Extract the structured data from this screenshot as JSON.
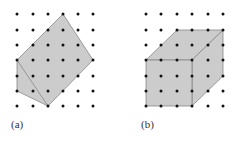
{
  "figures": [
    {
      "id": "a",
      "label": "(a)",
      "shape": "hexagonal polygon on dot lattice"
    },
    {
      "id": "b",
      "label": "(b)",
      "shape": "cube drawn on dot lattice"
    }
  ],
  "colors": {
    "fill": "#cccccc",
    "stroke": "#888888",
    "dot": "#111111"
  },
  "lattice": {
    "rows": [
      14,
      30,
      45,
      60,
      76,
      91,
      106
    ],
    "cols_a": [
      17,
      33,
      48,
      63,
      78,
      93
    ],
    "cols_b": [
      146,
      161,
      177,
      192,
      208,
      223
    ]
  }
}
